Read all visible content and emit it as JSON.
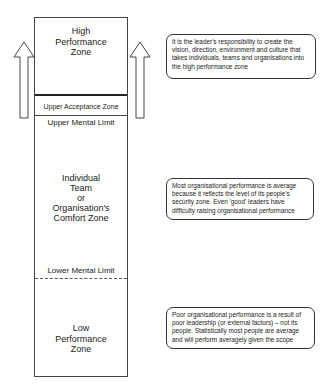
{
  "diagram": {
    "zones": {
      "high_performance": "High Performance Zone",
      "upper_acceptance": "Upper Acceptance Zone",
      "upper_mental_limit": "Upper Mental Limit",
      "comfort_line1": "Individual",
      "comfort_line2": "Team",
      "comfort_line3": "or",
      "comfort_line4": "Organisation's",
      "comfort_line5": "Comfort Zone",
      "lower_mental_limit": "Lower Mental Limit",
      "low_performance": "Low Performance Zone"
    },
    "notes": {
      "top": "It is the leader's responsibility to create the vision, direction, environment and culture that takes individuals, teams and organisations into the high performance zone",
      "middle": "Most organisational performance is average because it reflects the level of its people's security zone. Even 'good' leaders have difficulty raising organisational performance",
      "bottom": "Poor organisational performance is a result of poor leadership (or external factors) – not its people. Statistically most people are average and will perform averagely given the scope"
    },
    "colors": {
      "line": "#333333",
      "background": "#ffffff"
    }
  }
}
